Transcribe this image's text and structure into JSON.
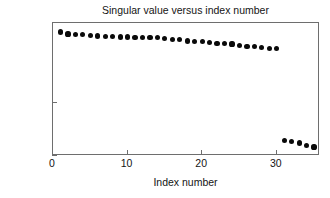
{
  "chart_data": {
    "type": "scatter",
    "title": "Singular value versus index number",
    "xlabel": "Index number",
    "ylabel": "Singular value",
    "yscale": "log",
    "xscale": "linear",
    "xlim": [
      0,
      35.8
    ],
    "ylim": [
      1e-06,
      10000.0
    ],
    "grid": false,
    "legend": null,
    "marker": "filled-circle",
    "marker_color": "#0a0a0a",
    "xticks": [
      0,
      10,
      20,
      30
    ],
    "xtick_labels": [
      "0",
      "10",
      "20",
      "30"
    ],
    "yticks": [
      1e-06,
      0.01,
      10000
    ],
    "ytick_labels": [
      "10−6",
      "10−2",
      "10⁴"
    ],
    "ytick_mantissa": [
      "10",
      "10",
      "10"
    ],
    "ytick_exponent": [
      "-6",
      "-2",
      "4"
    ],
    "x": [
      1,
      2,
      3,
      4,
      5,
      6,
      7,
      8,
      9,
      10,
      11,
      12,
      13,
      14,
      15,
      16,
      17,
      18,
      19,
      20,
      21,
      22,
      23,
      24,
      25,
      26,
      27,
      28,
      29,
      30,
      31,
      32,
      33,
      34,
      35
    ],
    "values": [
      2100,
      1500,
      1400,
      1450,
      1200,
      1050,
      1000,
      950,
      900,
      880,
      860,
      840,
      820,
      800,
      700,
      600,
      560,
      440,
      400,
      380,
      340,
      300,
      280,
      260,
      210,
      175,
      165,
      140,
      125,
      115,
      1.55e-05,
      1.15e-05,
      9.5e-06,
      5.8e-06,
      4.8e-06
    ],
    "n_points": 35,
    "cluster_upper_count": 30,
    "cluster_lower_count": 5
  },
  "figure": {
    "background_color": "#ffffff",
    "axis_color": "#6e6e6e",
    "text_color": "#141414"
  }
}
